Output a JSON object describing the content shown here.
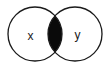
{
  "diagram": {
    "type": "venn",
    "sets": [
      {
        "label": "x"
      },
      {
        "label": "y"
      }
    ],
    "highlighted_region": "intersection",
    "colors": {
      "stroke": "#1a1a1a",
      "fill_highlight": "#0a0a0a",
      "background": "#ffffff"
    }
  }
}
